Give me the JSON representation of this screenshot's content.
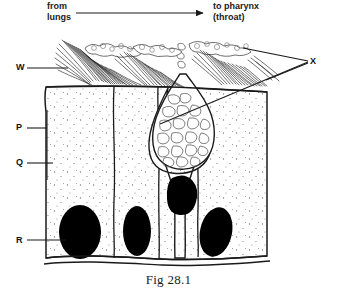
{
  "figure": {
    "caption": "Fig 28.1"
  },
  "flow": {
    "from_line1": "from",
    "from_line2": "lungs",
    "to_line1": "to pharynx",
    "to_line2": "(throat)",
    "arrow_icon": "arrow-right-icon"
  },
  "labels": {
    "w": "W",
    "p": "P",
    "q": "Q",
    "r": "R",
    "x": "X"
  },
  "colors": {
    "ink": "#1a1a1a",
    "nucleus": "#000000",
    "cytoplasm": "#ffffff",
    "stipple": "#6b6b6b"
  }
}
